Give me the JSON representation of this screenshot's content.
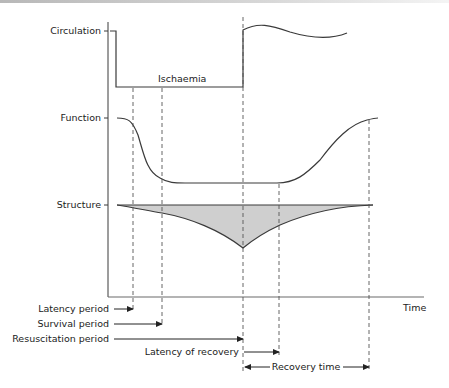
{
  "diagram": {
    "rows": {
      "circulation": "Circulation",
      "function": "Function",
      "structure": "Structure"
    },
    "annotations": {
      "ischaemia": "Ischaemia",
      "time_axis": "Time"
    },
    "periods": {
      "latency": "Latency period",
      "survival": "Survival period",
      "resuscitation": "Resuscitation period",
      "latency_recovery": "Latency of recovery",
      "recovery_time": "Recovery time"
    },
    "colors": {
      "line": "#3a3a3a",
      "shading": "#cfcfcf",
      "text": "#222222"
    }
  }
}
